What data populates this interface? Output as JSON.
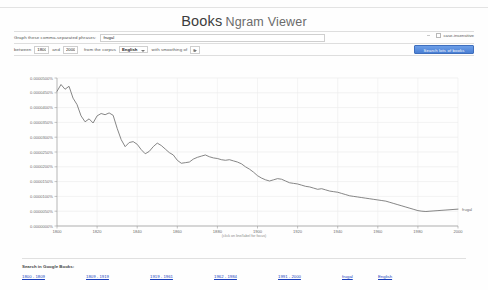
{
  "header": {
    "brand_books": "Books",
    "brand_ngram": "Ngram Viewer"
  },
  "form": {
    "phrase_label": "Graph these comma-separated phrases:",
    "phrase_value": "frugal",
    "phrase_placeholder": "",
    "case_insensitive_label": "case-insensitive",
    "between_label": "between",
    "year_start": "1800",
    "and_label": "and",
    "year_end": "2000",
    "corpus_label": "from the corpus",
    "corpus_value": "English",
    "smoothing_label": "with smoothing of",
    "smoothing_value": "3",
    "search_button": "Search lots of books"
  },
  "chart_data": {
    "type": "line",
    "title": "",
    "xlabel": "",
    "ylabel": "",
    "annotation": "(click on line/label for focus)",
    "series_label": "frugal",
    "xlim": [
      1800,
      2000
    ],
    "ylim": [
      0.0,
      5e-05
    ],
    "grid": true,
    "legend_position": "right-inline",
    "xticks": [
      1800,
      1820,
      1840,
      1860,
      1880,
      1900,
      1920,
      1940,
      1960,
      1980,
      2000
    ],
    "ytick_labels": [
      "0.0000500%",
      "0.0000450%",
      "0.0000400%",
      "0.0000350%",
      "0.0000300%",
      "0.0000250%",
      "0.0000200%",
      "0.0000150%",
      "0.0000100%",
      "0.0000050%",
      "0.0000000%"
    ],
    "yticks": [
      5e-05,
      4.5e-05,
      4e-05,
      3.5e-05,
      3e-05,
      2.5e-05,
      2e-05,
      1.5e-05,
      1e-05,
      5e-06,
      0.0
    ],
    "series": [
      {
        "name": "frugal",
        "color": "#707070",
        "x": [
          1800,
          1802,
          1804,
          1806,
          1808,
          1810,
          1812,
          1814,
          1816,
          1818,
          1820,
          1822,
          1824,
          1826,
          1828,
          1830,
          1832,
          1834,
          1836,
          1838,
          1840,
          1842,
          1844,
          1846,
          1848,
          1850,
          1852,
          1854,
          1856,
          1858,
          1860,
          1862,
          1864,
          1866,
          1868,
          1870,
          1872,
          1874,
          1876,
          1878,
          1880,
          1882,
          1884,
          1886,
          1888,
          1890,
          1892,
          1894,
          1896,
          1898,
          1900,
          1902,
          1904,
          1906,
          1908,
          1910,
          1912,
          1914,
          1916,
          1918,
          1920,
          1922,
          1924,
          1926,
          1928,
          1930,
          1932,
          1934,
          1936,
          1938,
          1940,
          1942,
          1944,
          1946,
          1948,
          1950,
          1952,
          1954,
          1956,
          1958,
          1960,
          1962,
          1964,
          1966,
          1968,
          1970,
          1972,
          1974,
          1976,
          1978,
          1980,
          1982,
          1984,
          1986,
          1988,
          1990,
          1992,
          1994,
          1996,
          1998,
          2000
        ],
        "values": [
          4.55e-05,
          4.78e-05,
          4.62e-05,
          4.72e-05,
          4.32e-05,
          4.1e-05,
          3.72e-05,
          3.52e-05,
          3.62e-05,
          3.48e-05,
          3.72e-05,
          3.8e-05,
          3.76e-05,
          3.82e-05,
          3.74e-05,
          3.3e-05,
          2.92e-05,
          2.68e-05,
          2.82e-05,
          2.85e-05,
          2.76e-05,
          2.58e-05,
          2.44e-05,
          2.52e-05,
          2.68e-05,
          2.8e-05,
          2.72e-05,
          2.6e-05,
          2.48e-05,
          2.4e-05,
          2.22e-05,
          2.12e-05,
          2.14e-05,
          2.16e-05,
          2.26e-05,
          2.32e-05,
          2.36e-05,
          2.4e-05,
          2.34e-05,
          2.3e-05,
          2.28e-05,
          2.24e-05,
          2.22e-05,
          2.24e-05,
          2.2e-05,
          2.16e-05,
          2.1e-05,
          2e-05,
          1.92e-05,
          1.82e-05,
          1.7e-05,
          1.62e-05,
          1.56e-05,
          1.52e-05,
          1.56e-05,
          1.6e-05,
          1.58e-05,
          1.52e-05,
          1.46e-05,
          1.44e-05,
          1.42e-05,
          1.38e-05,
          1.34e-05,
          1.32e-05,
          1.28e-05,
          1.24e-05,
          1.26e-05,
          1.22e-05,
          1.18e-05,
          1.16e-05,
          1.14e-05,
          1.1e-05,
          1.06e-05,
          1.02e-05,
          1e-05,
          9.8e-06,
          9.6e-06,
          9.4e-06,
          9.2e-06,
          9e-06,
          8.8e-06,
          8.6e-06,
          8.4e-06,
          8e-06,
          7.6e-06,
          7.2e-06,
          6.8e-06,
          6.4e-06,
          6e-06,
          5.6e-06,
          5.2e-06,
          5e-06,
          4.9e-06,
          5e-06,
          5.1e-06,
          5.2e-06,
          5.3e-06,
          5.4e-06,
          5.5e-06,
          5.6e-06,
          5.7e-06
        ]
      }
    ]
  },
  "footer": {
    "title": "Search in Google Books:",
    "links": [
      {
        "label": "1800 - 1809",
        "narrow": false
      },
      {
        "label": "1809 - 1919",
        "narrow": false
      },
      {
        "label": "1919 - 1961",
        "narrow": false
      },
      {
        "label": "1962 - 1984",
        "narrow": false
      },
      {
        "label": "1991 - 2000",
        "narrow": false
      },
      {
        "label": "frugal",
        "narrow": true
      },
      {
        "label": "English",
        "narrow": true
      }
    ]
  }
}
